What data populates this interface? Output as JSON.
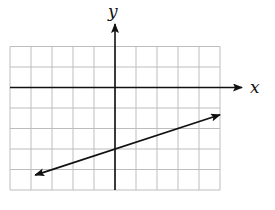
{
  "chart_data": {
    "type": "line",
    "title": "",
    "xlabel": "x",
    "ylabel": "y",
    "xlim": [
      -5,
      5
    ],
    "ylim": [
      -5,
      2
    ],
    "grid": true,
    "grid_spacing": 1,
    "tick_labels": false,
    "series": [
      {
        "name": "line",
        "equation": "y = (1/3)x - 3",
        "slope": 0.3333,
        "y_intercept": -3,
        "x": [
          -3.8,
          5
        ],
        "y": [
          -4.27,
          -1.33
        ],
        "arrows": "both"
      }
    ]
  },
  "labels": {
    "x_axis": "x",
    "y_axis": "y"
  },
  "colors": {
    "grid": "#bdbdbd",
    "axis": "#111111",
    "line": "#111111"
  }
}
